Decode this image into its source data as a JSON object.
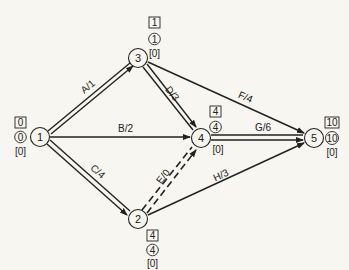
{
  "diagram": {
    "type": "activity-on-arrow network (CPM)",
    "nodes": [
      {
        "id": "1",
        "label": "1",
        "x": 40,
        "y": 137,
        "earliest": "0",
        "latest": "0",
        "slack": "[0]",
        "label_pos": "left"
      },
      {
        "id": "2",
        "label": "2",
        "x": 138,
        "y": 219,
        "earliest": "4",
        "latest": "4",
        "slack": "[0]",
        "label_pos": "below-right"
      },
      {
        "id": "3",
        "label": "3",
        "x": 138,
        "y": 58,
        "earliest": "1",
        "latest": "1",
        "slack": "[0]",
        "label_pos": "above-right"
      },
      {
        "id": "4",
        "label": "4",
        "x": 201,
        "y": 138,
        "earliest": "4",
        "latest": "4",
        "slack": "[0]",
        "label_pos": "above-right"
      },
      {
        "id": "5",
        "label": "5",
        "x": 314,
        "y": 138,
        "earliest": "10",
        "latest": "10",
        "slack": "[0]",
        "label_pos": "right"
      }
    ],
    "edges": [
      {
        "from": "1",
        "to": "3",
        "label": "A/1",
        "critical": true,
        "dummy": false
      },
      {
        "from": "1",
        "to": "4",
        "label": "B/2",
        "critical": false,
        "dummy": false
      },
      {
        "from": "1",
        "to": "2",
        "label": "C/4",
        "critical": true,
        "dummy": false
      },
      {
        "from": "3",
        "to": "4",
        "label": "D/3",
        "critical": true,
        "dummy": false
      },
      {
        "from": "2",
        "to": "4",
        "label": "E/0",
        "critical": true,
        "dummy": true
      },
      {
        "from": "3",
        "to": "5",
        "label": "F/4",
        "critical": false,
        "dummy": false
      },
      {
        "from": "4",
        "to": "5",
        "label": "G/6",
        "critical": true,
        "dummy": false
      },
      {
        "from": "2",
        "to": "5",
        "label": "H/3",
        "critical": false,
        "dummy": false
      }
    ],
    "colors": {
      "ink": "#222222",
      "background": "#f7f6f1"
    }
  }
}
